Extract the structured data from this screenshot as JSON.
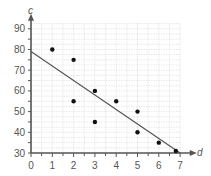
{
  "chart_data": {
    "type": "scatter",
    "title": "",
    "xlabel": "d",
    "ylabel": "c",
    "xlim": [
      0,
      7
    ],
    "ylim": [
      30,
      92.5
    ],
    "x_ticks": [
      "0",
      "1",
      "2",
      "3",
      "4",
      "5",
      "6",
      "7"
    ],
    "y_ticks": [
      "30",
      "40",
      "50",
      "60",
      "70",
      "80",
      "90"
    ],
    "grid": true,
    "legend": null,
    "points": [
      {
        "x": 1,
        "y": 80
      },
      {
        "x": 2,
        "y": 75
      },
      {
        "x": 2,
        "y": 55
      },
      {
        "x": 3,
        "y": 60
      },
      {
        "x": 3,
        "y": 45
      },
      {
        "x": 4,
        "y": 55
      },
      {
        "x": 5,
        "y": 50
      },
      {
        "x": 5,
        "y": 40
      },
      {
        "x": 6,
        "y": 35
      },
      {
        "x": 6.8,
        "y": 31
      }
    ],
    "trend_line": {
      "x0": 0,
      "y0": 79,
      "x1": 7,
      "y1": 30
    },
    "colors": {
      "axis": "#555555",
      "grid": "#d9d9d9",
      "point": "#111111",
      "line": "#555555"
    }
  }
}
